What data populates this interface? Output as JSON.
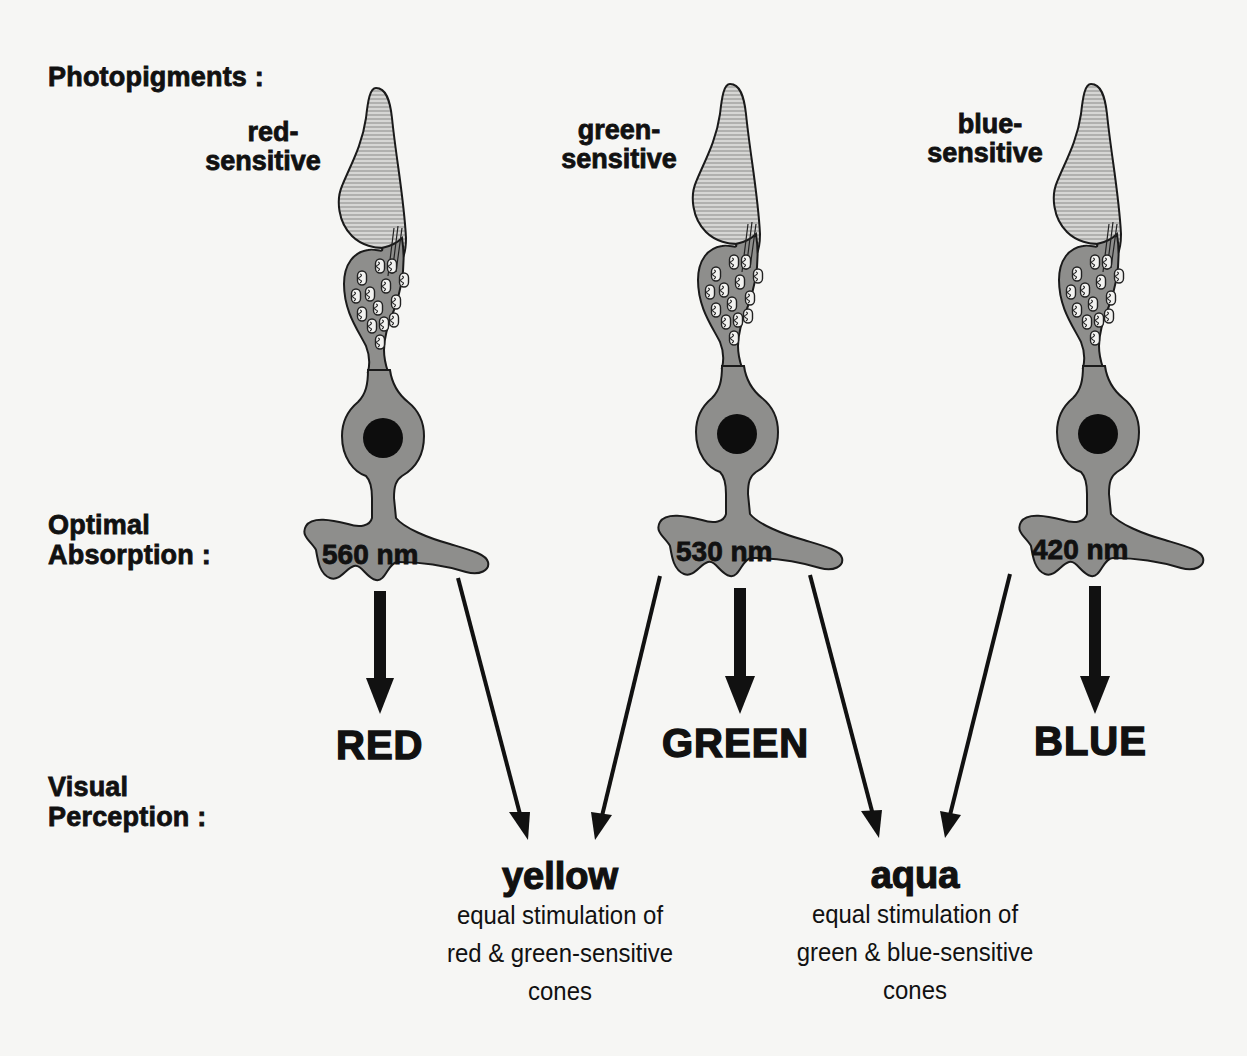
{
  "row_labels": {
    "photopigments": "Photopigments :",
    "optimal_line1": "Optimal",
    "optimal_line2": "Absorption :",
    "visual_line1": "Visual",
    "visual_line2": "Perception :"
  },
  "cones": [
    {
      "label_line1": "red-",
      "label_line2": "sensitive",
      "absorption": "560 nm",
      "perception": "RED"
    },
    {
      "label_line1": "green-",
      "label_line2": "sensitive",
      "absorption": "530 nm",
      "perception": "GREEN"
    },
    {
      "label_line1": "blue-",
      "label_line2": "sensitive",
      "absorption": "420 nm",
      "perception": "BLUE"
    }
  ],
  "mixtures": [
    {
      "name": "yellow",
      "desc_line1": "equal stimulation of",
      "desc_line2": "red & green-sensitive",
      "desc_line3": "cones"
    },
    {
      "name": "aqua",
      "desc_line1": "equal stimulation of",
      "desc_line2": "green & blue-sensitive",
      "desc_line3": "cones"
    }
  ],
  "colors": {
    "background": "#f6f6f4",
    "outer_segment": "#c9c9c7",
    "cell_body": "#8e8e8c",
    "nucleus": "#0d0d0d",
    "ink": "#111111"
  }
}
